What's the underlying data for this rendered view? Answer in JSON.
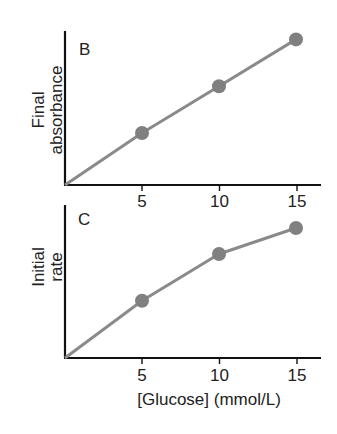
{
  "chart_data": [
    {
      "type": "line",
      "panel_label": "B",
      "title": "",
      "ylabel_lines": [
        "Final",
        "absorbance"
      ],
      "xlabel": "",
      "x": [
        0,
        5,
        10,
        15
      ],
      "tick_labels": [
        "5",
        "10",
        "15"
      ],
      "xlim": [
        0,
        18
      ],
      "ylim": [
        0,
        3.2
      ],
      "y_units": "arbitrary (no y ticks shown)",
      "series": [
        {
          "name": "Final absorbance",
          "x": [
            0,
            5,
            10,
            15
          ],
          "values": [
            0,
            1.0,
            1.9,
            2.8
          ],
          "markers_at": [
            5,
            10,
            15
          ],
          "color": "#808080"
        }
      ],
      "grid": false,
      "legend": null
    },
    {
      "type": "line",
      "panel_label": "C",
      "title": "",
      "ylabel_lines": [
        "Initial",
        "rate"
      ],
      "xlabel": "[Glucose] (mmol/L)",
      "x": [
        0,
        5,
        10,
        15
      ],
      "tick_labels": [
        "5",
        "10",
        "15"
      ],
      "xlim": [
        0,
        18
      ],
      "ylim": [
        0,
        3.2
      ],
      "y_units": "arbitrary (no y ticks shown)",
      "series": [
        {
          "name": "Initial rate",
          "x": [
            0,
            5,
            10,
            15
          ],
          "values": [
            0,
            1.1,
            2.0,
            2.5
          ],
          "markers_at": [
            5,
            10,
            15
          ],
          "color": "#808080"
        }
      ],
      "grid": false,
      "legend": null
    }
  ]
}
